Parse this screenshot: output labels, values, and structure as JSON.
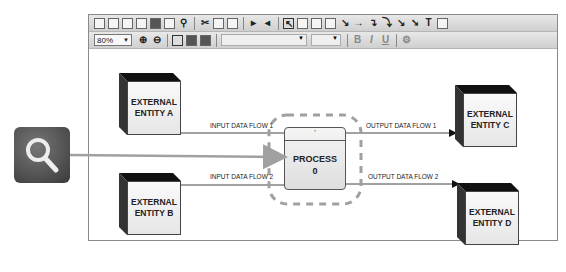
{
  "toolbar": {
    "row1_icons": [
      "new-icon",
      "page-icon",
      "blank-page-icon",
      "open-icon",
      "save-icon",
      "print-icon",
      "find-icon",
      "cut-icon",
      "copy-icon",
      "paste-icon",
      "import-icon",
      "undo-icon",
      "pointer-icon",
      "rectangle-icon",
      "stack-icon",
      "box-icon",
      "line-icon",
      "arrow-icon",
      "elbow-connector-icon",
      "curve-connector-icon",
      "diagonal-connector-icon",
      "bold-connector-icon",
      "text-icon",
      "image-icon"
    ],
    "zoom_level": "80%",
    "font_name": "",
    "font_size": "",
    "bold_label": "B",
    "italic_label": "I",
    "underline_label": "U",
    "text_tool_label": "T"
  },
  "diagram": {
    "entities": [
      {
        "id": "A",
        "line1": "EXTERNAL",
        "line2": "ENTITY A"
      },
      {
        "id": "B",
        "line1": "EXTERNAL",
        "line2": "ENTITY B"
      },
      {
        "id": "C",
        "line1": "EXTERNAL",
        "line2": "ENTITY C"
      },
      {
        "id": "D",
        "line1": "EXTERNAL",
        "line2": "ENTITY D"
      }
    ],
    "process": {
      "title": "PROCESS",
      "number": "0",
      "header": "'"
    },
    "flows": [
      {
        "label": "INPUT DATA FLOW 1"
      },
      {
        "label": "INPUT DATA FLOW 2"
      },
      {
        "label": "OUTPUT DATA FLOW 1"
      },
      {
        "label": "OUTPUT DATA FLOW 2"
      }
    ]
  },
  "overlay": {
    "icon": "magnifier-icon",
    "highlight_color": "#a0a0a0"
  }
}
